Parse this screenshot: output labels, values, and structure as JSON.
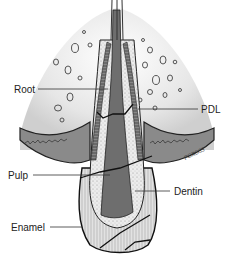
{
  "diagram": {
    "labels": {
      "root": "Root",
      "pdl": "PDL",
      "pulp": "Pulp",
      "dentin": "Dentin",
      "enamel": "Enamel"
    },
    "signature": "PGROSS"
  }
}
